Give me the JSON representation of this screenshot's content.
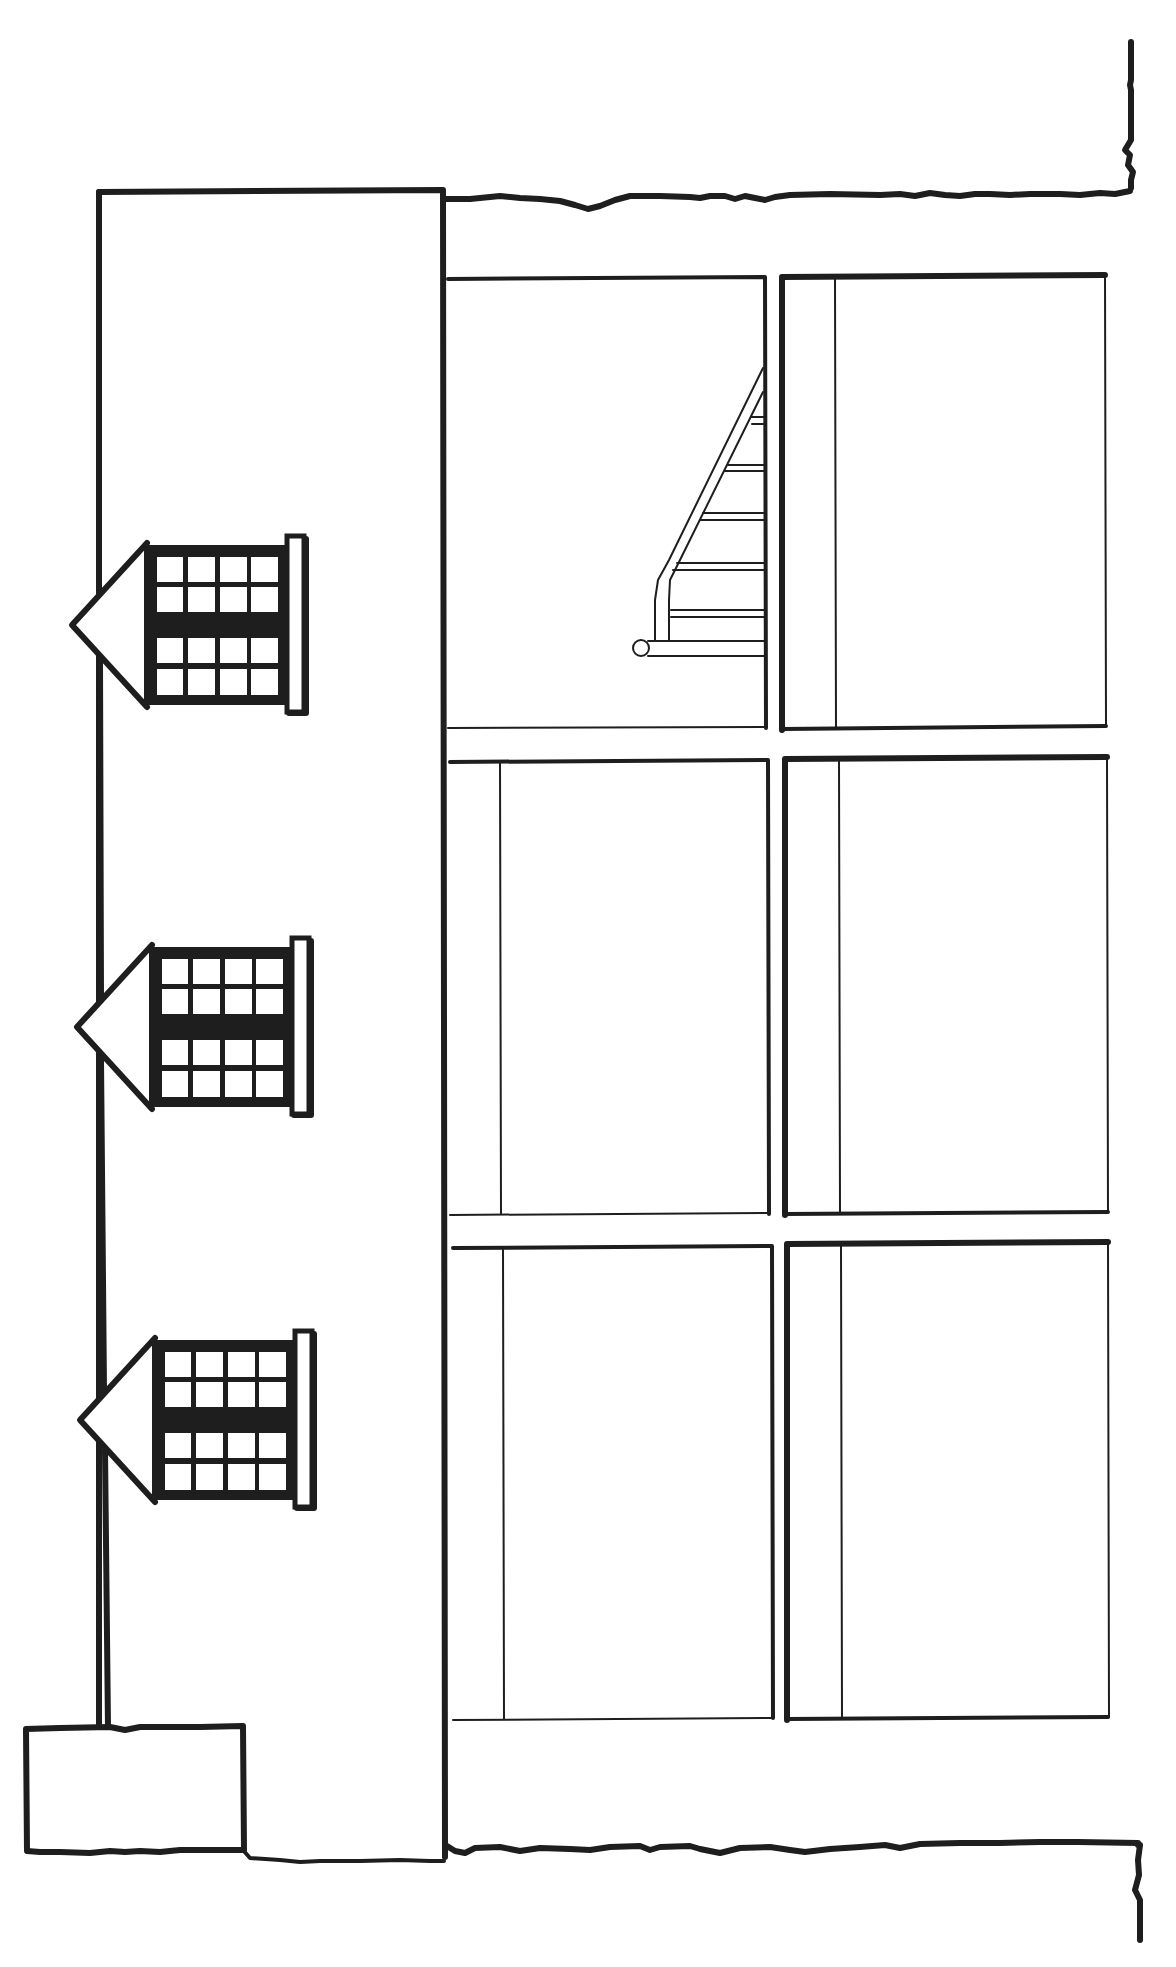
{
  "drawing": {
    "type": "architectural-elevation-line-drawing",
    "orientation": "rotated",
    "colors": {
      "ink": "#1e1e1e",
      "paper": "#ffffff"
    },
    "building_block": {
      "x": 97,
      "y": 190,
      "width": 348,
      "height": 1665
    },
    "base_box": {
      "x": 25,
      "y": 1727,
      "width": 220,
      "height": 126
    },
    "dormers": [
      {
        "name": "dormer-window-1",
        "cy": 625
      },
      {
        "name": "dormer-window-2",
        "cy": 1027
      },
      {
        "name": "dormer-window-3",
        "cy": 1420
      }
    ],
    "panels": [
      {
        "name": "panel-row1-left",
        "x": 448,
        "y": 277,
        "w": 317,
        "h": 451,
        "inner_x": null
      },
      {
        "name": "panel-row1-right",
        "x": 782,
        "y": 275,
        "w": 323,
        "h": 452,
        "inner_x": 835
      },
      {
        "name": "panel-row2-left",
        "x": 450,
        "y": 760,
        "w": 318,
        "h": 455,
        "inner_x": 500
      },
      {
        "name": "panel-row2-right",
        "x": 785,
        "y": 757,
        "w": 322,
        "h": 456,
        "inner_x": 840
      },
      {
        "name": "panel-row3-left",
        "x": 453,
        "y": 1245,
        "w": 319,
        "h": 473,
        "inner_x": 503
      },
      {
        "name": "panel-row3-right",
        "x": 787,
        "y": 1242,
        "w": 321,
        "h": 473,
        "inner_x": 842
      }
    ],
    "staircase": {
      "treads_y": [
        420,
        468,
        518,
        568,
        615,
        648
      ]
    },
    "text_labels": []
  }
}
